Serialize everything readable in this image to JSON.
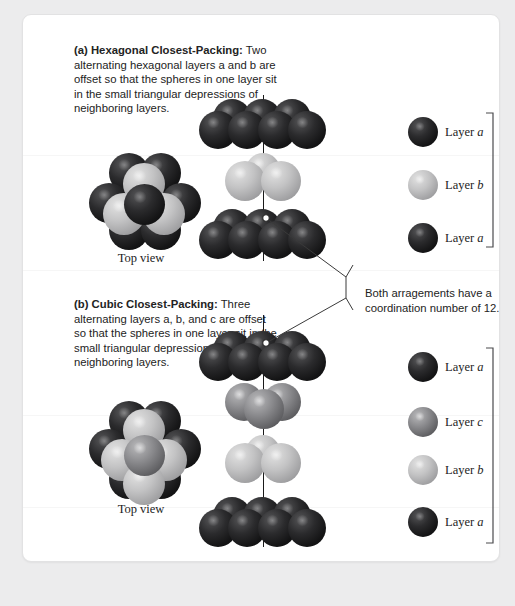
{
  "figure": {
    "background_color": "#ececed",
    "card_color": "#ffffff"
  },
  "panel_a": {
    "label": "(a)",
    "title": "Hexagonal Closest-Packing:",
    "body": " Two alternating hexagonal layers a and b are offset so that the spheres in one layer sit in the small triangular depressions of neighboring layers.",
    "topview_caption": "Top view",
    "stack_layers": [
      {
        "name": "Layer a",
        "layer_letter": "a",
        "color": "#141415",
        "tone": "dark",
        "sphere_count": 7
      },
      {
        "name": "Layer b",
        "layer_letter": "b",
        "color": "#9d9d9f",
        "tone": "light",
        "sphere_count": 3
      },
      {
        "name": "Layer a",
        "layer_letter": "a",
        "color": "#141415",
        "tone": "dark",
        "sphere_count": 7
      }
    ],
    "legend": [
      {
        "label_prefix": "Layer ",
        "letter": "a",
        "tone": "dark",
        "color": "#141415"
      },
      {
        "label_prefix": "Layer ",
        "letter": "b",
        "tone": "light",
        "color": "#9d9d9f"
      },
      {
        "label_prefix": "Layer ",
        "letter": "a",
        "tone": "dark",
        "color": "#141415"
      }
    ]
  },
  "panel_b": {
    "label": "(b)",
    "title": "Cubic Closest-Packing:",
    "body": " Three alternating layers a, b, and c are offset so that the spheres in one layer sit in the small triangular depressions of neighboring layers.",
    "topview_caption": "Top view",
    "stack_layers": [
      {
        "name": "Layer a",
        "layer_letter": "a",
        "color": "#141415",
        "tone": "dark",
        "sphere_count": 7
      },
      {
        "name": "Layer c",
        "layer_letter": "c",
        "color": "#5e5e61",
        "tone": "mid",
        "sphere_count": 3
      },
      {
        "name": "Layer b",
        "layer_letter": "b",
        "color": "#9d9d9f",
        "tone": "light",
        "sphere_count": 3
      },
      {
        "name": "Layer a",
        "layer_letter": "a",
        "color": "#141415",
        "tone": "dark",
        "sphere_count": 7
      }
    ],
    "legend": [
      {
        "label_prefix": "Layer ",
        "letter": "a",
        "tone": "dark",
        "color": "#141415"
      },
      {
        "label_prefix": "Layer ",
        "letter": "c",
        "tone": "mid",
        "color": "#5e5e61"
      },
      {
        "label_prefix": "Layer ",
        "letter": "b",
        "tone": "light",
        "color": "#9d9d9f"
      },
      {
        "label_prefix": "Layer ",
        "letter": "a",
        "tone": "dark",
        "color": "#141415"
      }
    ]
  },
  "annotation": {
    "line1": "Both arragements have a",
    "line2": "coordination number of 12.",
    "full_text": "Both arragements have a coordination number of 12.",
    "coordination_number": 12
  }
}
